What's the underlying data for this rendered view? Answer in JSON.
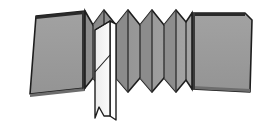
{
  "figure": {
    "background_color": "#ffffff",
    "width": 267,
    "height": 134
  },
  "palette": {
    "panel_fill": "#9a9a9a",
    "panel_fill_light": "#a6a6a6",
    "panel_fill_dark": "#8e8e8e",
    "fold_face_a": "#9c9c9c",
    "fold_face_b": "#8a8a8a",
    "blade_fill": "#f2f2f2",
    "blade_fill_shadow": "#e2e2e2",
    "outline_color": "#1e1e1e",
    "fold_line_color": "#2b2b2b",
    "edge_shadow": "#5a5a5a"
  },
  "strokes": {
    "outline_width": 1.6,
    "fold_width": 1.3,
    "blade_width": 1.4,
    "crease_width": 1.1
  },
  "parts": {
    "left_panel": {
      "label": "left flat panel",
      "points": "30,94 36,16 85,11 85,88",
      "top_edge": "36,16 85,11",
      "bottom_edge": "30,94 85,88"
    },
    "right_panel": {
      "label": "right flat panel",
      "points": "192,13 245,13 252,20 250,92 192,89",
      "top_edge": "192,13 245,13",
      "bottom_edge": "192,89 250,92"
    },
    "accordion": {
      "label": "accordion pleat band",
      "outline": "85,11 93,25 104,10 116,25 128,10 140,25 152,10 164,25 176,10 186,22 192,13 192,89 186,80 176,92 164,78 152,92 140,78 128,92 116,78 104,92 93,78 85,88",
      "fold_lines": [
        "93,25 93,78",
        "104,10 104,92",
        "116,25 116,78",
        "128,10 128,92",
        "140,25 140,78",
        "152,10 152,92",
        "164,25 164,78",
        "176,10 176,92",
        "186,22 186,80"
      ],
      "peak_count": 5,
      "valley_count": 4
    },
    "blade": {
      "label": "inserted white blade sheet",
      "front_face": "95,30 110,21 110,116 99,108 95,118",
      "side_face": "110,21 116,24 116,120 110,116",
      "crease_line": "95,72 110,55",
      "torn_bottom": "95,118 99,108 104,116 110,116",
      "top_tip": "95,30 110,21"
    }
  },
  "annotations": {
    "has_labels": false,
    "label_texts": []
  }
}
